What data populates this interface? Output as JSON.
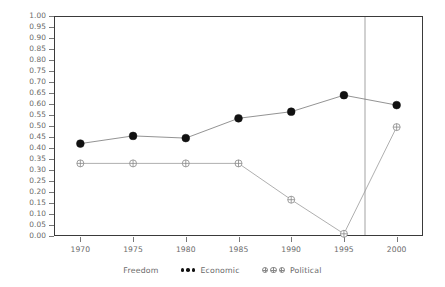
{
  "chart_data": {
    "type": "line",
    "title": "",
    "xlabel": "",
    "ylabel": "",
    "x": [
      1970,
      1975,
      1980,
      1985,
      1990,
      1995,
      2000
    ],
    "xtick_labels": [
      "1970",
      "1975",
      "1980",
      "1985",
      "1990",
      "1995",
      "2000"
    ],
    "ytick_labels": [
      "1.00",
      "0.95",
      "0.90",
      "0.85",
      "0.80",
      "0.75",
      "0.70",
      "0.65",
      "0.60",
      "0.55",
      "0.50",
      "0.45",
      "0.40",
      "0.35",
      "0.30",
      "0.25",
      "0.20",
      "0.15",
      "0.10",
      "0.05",
      "0.00"
    ],
    "ylim": [
      0.0,
      1.0
    ],
    "xlim": [
      1967.5,
      2002.5
    ],
    "ytick_step": 0.05,
    "grid": false,
    "legend_position": "bottom-center",
    "legend_title": "Freedom",
    "series": [
      {
        "name": "Economic",
        "marker": "filled-circle",
        "color": "#111111",
        "values": [
          0.42,
          0.455,
          0.445,
          0.535,
          0.565,
          0.64,
          0.595
        ]
      },
      {
        "name": "Political",
        "marker": "crossed-circle",
        "color": "#888888",
        "values": [
          0.33,
          0.33,
          0.33,
          0.33,
          0.165,
          0.01,
          0.495
        ]
      }
    ],
    "annotations": [
      {
        "type": "vertical-reference-line",
        "name": "reference-line",
        "x": 1997,
        "color": "#999999"
      }
    ]
  }
}
